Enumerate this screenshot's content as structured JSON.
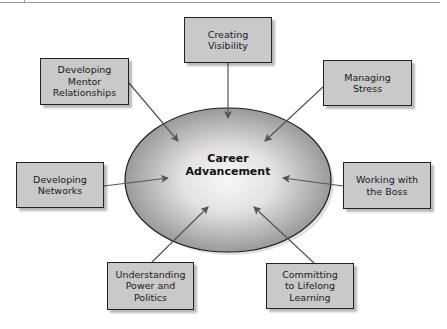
{
  "center": {
    "label": "Career\nAdvancement"
  },
  "nodes": [
    {
      "id": "creating-visibility",
      "label": "Creating\nVisibility"
    },
    {
      "id": "developing-mentor-relationships",
      "label": "Developing\nMentor\nRelationships"
    },
    {
      "id": "managing-stress",
      "label": "Managing\nStress"
    },
    {
      "id": "developing-networks",
      "label": "Developing\nNetworks"
    },
    {
      "id": "working-with-the-boss",
      "label": "Working with\nthe Boss"
    },
    {
      "id": "understanding-power-and-politics",
      "label": "Understanding\nPower and\nPolitics"
    },
    {
      "id": "committing-to-lifelong-learning",
      "label": "Committing\nto Lifelong\nLearning"
    }
  ],
  "colors": {
    "box_fill": "#c9c9c9",
    "ellipse_center": "#f4f4f4",
    "ellipse_edge": "#9c9c9c",
    "arrow": "#555555"
  }
}
